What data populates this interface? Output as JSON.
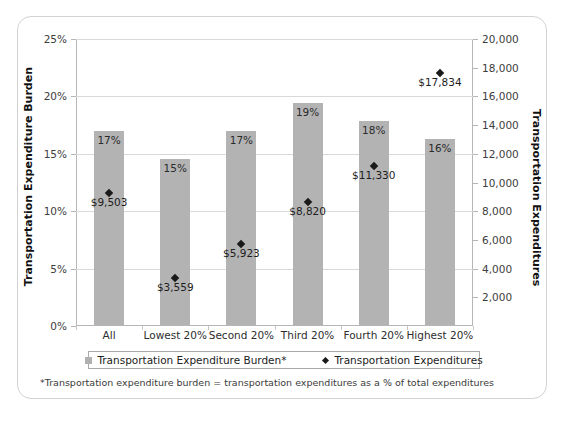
{
  "chart_data": {
    "type": "bar",
    "title": "",
    "subtitle": "",
    "xlabel": "",
    "ylabel": "Transportation Expenditure Burden",
    "y2label": "Transportation Expenditures",
    "categories": [
      "All",
      "Lowest 20%",
      "Second 20%",
      "Third 20%",
      "Fourth 20%",
      "Highest 20%"
    ],
    "grid": true,
    "legend_position": "bottom",
    "ylim": [
      0,
      25
    ],
    "y2lim": [
      0,
      20000
    ],
    "yticks": [
      "0%",
      "5%",
      "10%",
      "15%",
      "20%",
      "25%"
    ],
    "ytick_values": [
      0,
      5,
      10,
      15,
      20,
      25
    ],
    "y2ticks": [
      "2,000",
      "4,000",
      "6,000",
      "8,000",
      "10,000",
      "12,000",
      "14,000",
      "16,000",
      "18,000",
      "20,000"
    ],
    "y2tick_values": [
      2000,
      4000,
      6000,
      8000,
      10000,
      12000,
      14000,
      16000,
      18000,
      20000
    ],
    "series": [
      {
        "name": "Transportation Expenditure Burden*",
        "type": "bar",
        "axis": "left",
        "unit": "percent",
        "color": "#b3b3b3",
        "values": [
          16.9,
          14.5,
          16.9,
          19.3,
          17.8,
          16.2
        ],
        "labels": [
          "17%",
          "15%",
          "17%",
          "19%",
          "18%",
          "16%"
        ]
      },
      {
        "name": "Transportation Expenditures",
        "type": "scatter",
        "axis": "right",
        "unit": "dollars",
        "color": "#1a1a1a",
        "values": [
          9503,
          3559,
          5923,
          8820,
          11330,
          17834
        ],
        "labels": [
          "$9,503",
          "$3,559",
          "$5,923",
          "$8,820",
          "$11,330",
          "$17,834"
        ]
      }
    ],
    "annotations": [
      "*Transportation expenditure burden = transportation expenditures as a % of total expenditures"
    ]
  },
  "axes": {
    "left_title": "Transportation Expenditure Burden",
    "right_title": "Transportation Expenditures"
  },
  "legend": {
    "items": [
      {
        "label": "Transportation Expenditure Burden*",
        "marker": "square-swatch-icon"
      },
      {
        "label": "Transportation Expenditures",
        "marker": "diamond-marker-icon"
      }
    ]
  },
  "footnote": {
    "text": "*Transportation expenditure burden = transportation expenditures as a % of total expenditures"
  },
  "colors": {
    "bar": "#b3b3b3",
    "marker": "#1a1a1a",
    "grid": "#d9d9d9",
    "axis": "#b6b6b6",
    "frame": "#d2d2d2"
  }
}
